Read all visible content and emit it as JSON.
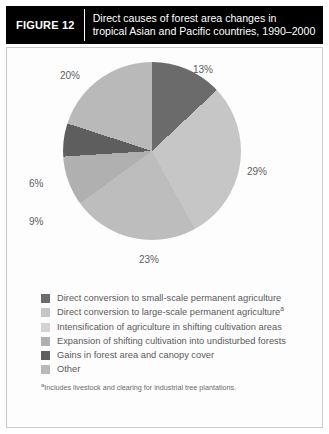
{
  "figure": {
    "label": "FIGURE 12",
    "title_line1": "Direct causes of forest area changes in",
    "title_line2": "tropical Asian and Pacific countries, 1990–2000",
    "header_bg": "#000000",
    "header_fg": "#ffffff",
    "panel_bg": "#fdfdfd",
    "panel_border": "#c9c9c9"
  },
  "chart_data": {
    "type": "pie",
    "title": "Direct causes of forest area changes in tropical Asian and Pacific countries, 1990–2000",
    "unit": "percent",
    "start_angle_deg": 0,
    "direction": "clockwise",
    "categories": [
      "Direct conversion to small-scale permanent agriculture",
      "Direct conversion to large-scale permanent agriculture",
      "Intensification of agriculture in shifting cultivation areas",
      "Expansion of shifting cultivation into undisturbed forests",
      "Gains in forest area and canopy cover",
      "Other"
    ],
    "values": [
      13,
      29,
      23,
      9,
      6,
      20
    ],
    "labels": [
      "13%",
      "29%",
      "23%",
      "9%",
      "6%",
      "20%"
    ],
    "colors": [
      "#6b6b6b",
      "#c6c6c6",
      "#bdbdbd",
      "#b0b0b0",
      "#5e5e5e",
      "#b9b9b9"
    ],
    "legend_position": "bottom",
    "grid": false
  },
  "legend": {
    "items": [
      {
        "label": "Direct conversion to small-scale permanent agriculture",
        "marker": "",
        "color": "#6b6b6b"
      },
      {
        "label": "Direct conversion to large-scale permanent agriculture",
        "marker": "a",
        "color": "#c6c6c6"
      },
      {
        "label": "Intensification of agriculture in shifting cultivation areas",
        "marker": "",
        "color": "#d3d3d3"
      },
      {
        "label": "Expansion of shifting cultivation into undisturbed forests",
        "marker": "",
        "color": "#b0b0b0"
      },
      {
        "label": "Gains in forest area and canopy cover",
        "marker": "",
        "color": "#5e5e5e"
      },
      {
        "label": "Other",
        "marker": "",
        "color": "#b9b9b9"
      }
    ]
  },
  "footnote": {
    "marker": "a",
    "text": "Includes livestock and clearing for industrial tree plantations."
  }
}
